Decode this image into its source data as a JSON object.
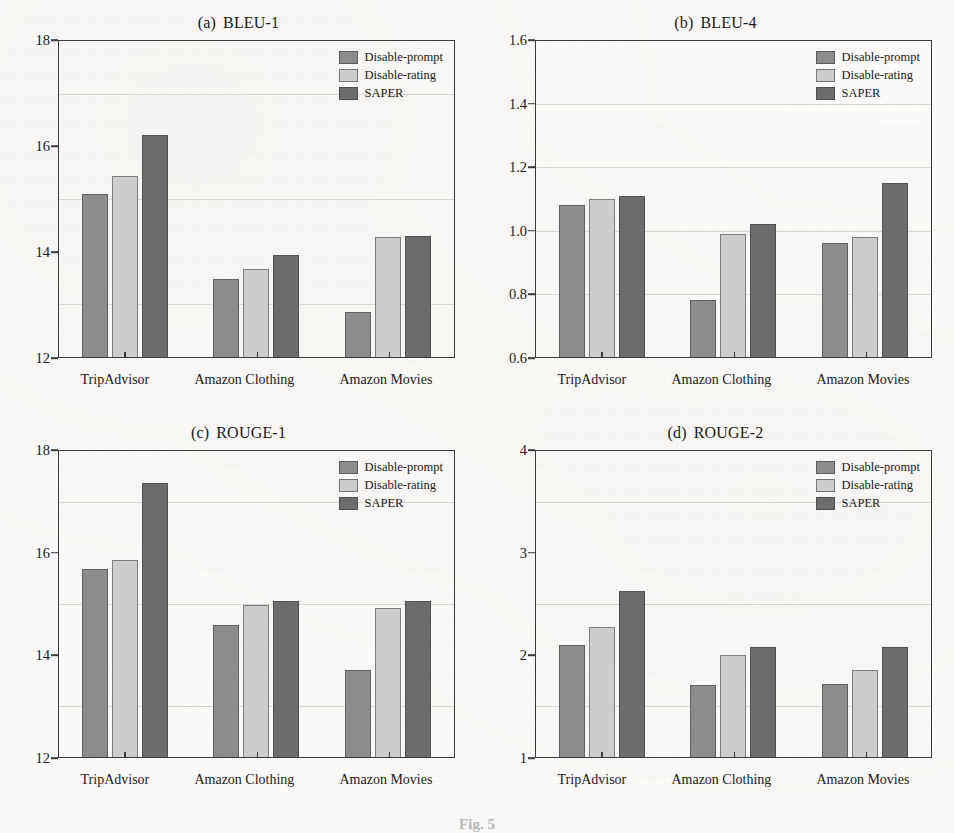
{
  "figure": {
    "caption_fragment": "Fig. 5",
    "series_names": [
      "Disable-prompt",
      "Disable-rating",
      "SAPER"
    ],
    "series_colors": [
      "#8c8c8c",
      "#cdcdcd",
      "#6c6c6c"
    ],
    "categories": [
      "TripAdvisor",
      "Amazon Clothing",
      "Amazon Movies"
    ]
  },
  "chart_data": [
    {
      "type": "bar",
      "panel_label": "(a)",
      "title": "BLEU-1",
      "categories": [
        "TripAdvisor",
        "Amazon Clothing",
        "Amazon Movies"
      ],
      "series": [
        {
          "name": "Disable-prompt",
          "values": [
            15.1,
            13.48,
            12.86
          ]
        },
        {
          "name": "Disable-rating",
          "values": [
            15.44,
            13.67,
            14.28
          ]
        },
        {
          "name": "SAPER",
          "values": [
            16.22,
            13.94,
            14.3
          ]
        }
      ],
      "xlabel": "",
      "ylabel": "",
      "ylim": [
        12,
        18
      ],
      "yticks": [
        12,
        14,
        16,
        18
      ],
      "ytick_labels": [
        "12",
        "14",
        "16",
        "18"
      ],
      "gridlines": [
        13,
        15,
        17
      ],
      "grid": true,
      "legend_position": "top-right"
    },
    {
      "type": "bar",
      "panel_label": "(b)",
      "title": "BLEU-4",
      "categories": [
        "TripAdvisor",
        "Amazon Clothing",
        "Amazon Movies"
      ],
      "series": [
        {
          "name": "Disable-prompt",
          "values": [
            1.08,
            0.78,
            0.96
          ]
        },
        {
          "name": "Disable-rating",
          "values": [
            1.1,
            0.99,
            0.98
          ]
        },
        {
          "name": "SAPER",
          "values": [
            1.11,
            1.02,
            1.15
          ]
        }
      ],
      "xlabel": "",
      "ylabel": "",
      "ylim": [
        0.6,
        1.6
      ],
      "yticks": [
        0.6,
        0.8,
        1.0,
        1.2,
        1.4,
        1.6
      ],
      "ytick_labels": [
        "0.6",
        "0.8",
        "1.0",
        "1.2",
        "1.4",
        "1.6"
      ],
      "gridlines": [
        0.8,
        1.0,
        1.2,
        1.4
      ],
      "grid": true,
      "legend_position": "top-right"
    },
    {
      "type": "bar",
      "panel_label": "(c)",
      "title": "ROUGE-1",
      "categories": [
        "TripAdvisor",
        "Amazon Clothing",
        "Amazon Movies"
      ],
      "series": [
        {
          "name": "Disable-prompt",
          "values": [
            15.69,
            14.58,
            13.71
          ]
        },
        {
          "name": "Disable-rating",
          "values": [
            15.86,
            14.98,
            14.93
          ]
        },
        {
          "name": "SAPER",
          "values": [
            17.38,
            15.06,
            15.06
          ]
        }
      ],
      "xlabel": "",
      "ylabel": "",
      "ylim": [
        12,
        18
      ],
      "yticks": [
        12,
        14,
        16,
        18
      ],
      "ytick_labels": [
        "12",
        "14",
        "16",
        "18"
      ],
      "gridlines": [
        13,
        15,
        17
      ],
      "grid": true,
      "legend_position": "top-right"
    },
    {
      "type": "bar",
      "panel_label": "(d)",
      "title": "ROUGE-2",
      "categories": [
        "TripAdvisor",
        "Amazon Clothing",
        "Amazon Movies"
      ],
      "series": [
        {
          "name": "Disable-prompt",
          "values": [
            2.1,
            1.71,
            1.72
          ]
        },
        {
          "name": "Disable-rating",
          "values": [
            2.27,
            2.0,
            1.85
          ]
        },
        {
          "name": "SAPER",
          "values": [
            2.63,
            2.08,
            2.08
          ]
        }
      ],
      "xlabel": "",
      "ylabel": "",
      "ylim": [
        1,
        4
      ],
      "yticks": [
        1,
        2,
        3,
        4
      ],
      "ytick_labels": [
        "1",
        "2",
        "3",
        "4"
      ],
      "gridlines": [
        1.5,
        2.5,
        3.5
      ],
      "grid": true,
      "legend_position": "top-right"
    }
  ]
}
